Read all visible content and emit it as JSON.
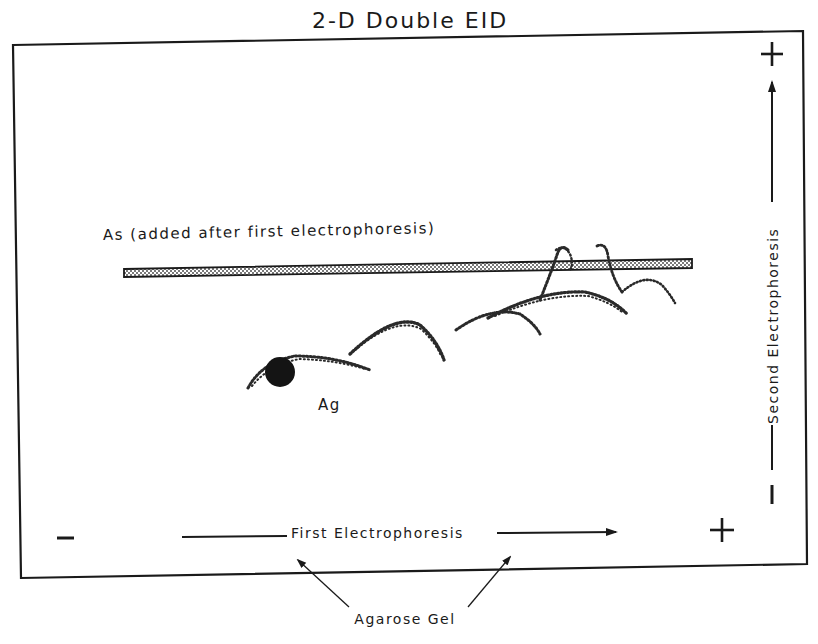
{
  "diagram": {
    "title": "2-D Double EID",
    "antiserum_label": "As (added after first electrophoresis)",
    "antigen_label": "Ag",
    "first_electrophoresis": {
      "label": "First Electrophoresis",
      "negative_sign": "–",
      "positive_sign": "+",
      "direction": "left-to-right"
    },
    "second_electrophoresis": {
      "label": "Second Electrophoresis",
      "negative_sign": "–",
      "positive_sign": "+",
      "direction": "bottom-to-top"
    },
    "gel_label": "Agarose Gel",
    "elements": [
      {
        "name": "antiserum-trough",
        "shape": "horizontal stippled bar",
        "x_start": 124,
        "x_end": 692,
        "y": 268
      },
      {
        "name": "antigen-well",
        "shape": "filled circle",
        "cx": 280,
        "cy": 372,
        "r": 15
      },
      {
        "name": "precipitin-arcs",
        "count": 6,
        "style": "stippled curves"
      }
    ],
    "colors": {
      "ink": "#1a1a1a",
      "background": "#ffffff",
      "trough_fill": "#d0d0d0"
    }
  }
}
